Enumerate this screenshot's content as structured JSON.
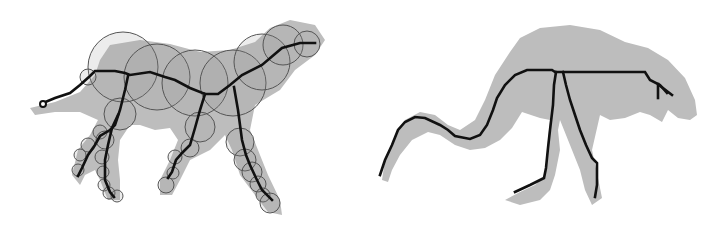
{
  "figure": {
    "panels": [
      {
        "name": "dog-medial-axis",
        "silhouette": "M30,108 L55,102 L80,92 L95,75 L100,60 L110,45 L140,40 L170,44 L200,52 L230,50 L255,42 L270,28 L290,20 L315,25 L325,40 L315,55 L295,70 L280,90 L255,105 L250,130 L258,150 L268,175 L280,200 L282,215 L268,212 L255,195 L240,175 L232,150 L225,135 L210,150 L190,160 L180,180 L172,195 L160,195 L160,180 L170,160 L178,140 L170,128 L155,130 L140,125 L130,125 L120,140 L118,160 L120,180 L120,200 L108,200 L100,180 L95,170 L85,175 L80,185 L72,175 L78,150 L90,135 L98,120 L80,112 L55,112 L35,115 Z",
        "circles": [
          [
            123,
            67,
            35
          ],
          [
            157,
            77,
            33
          ],
          [
            195,
            83,
            33
          ],
          [
            233,
            83,
            33
          ],
          [
            262,
            62,
            28
          ],
          [
            283,
            45,
            20
          ],
          [
            307,
            44,
            13
          ],
          [
            120,
            114,
            16
          ],
          [
            100,
            132,
            7
          ],
          [
            88,
            145,
            7
          ],
          [
            80,
            155,
            6
          ],
          [
            78,
            170,
            6
          ],
          [
            105,
            140,
            9
          ],
          [
            102,
            157,
            7
          ],
          [
            103,
            172,
            6
          ],
          [
            104,
            185,
            6
          ],
          [
            109,
            193,
            6
          ],
          [
            117,
            196,
            6
          ],
          [
            200,
            127,
            15
          ],
          [
            190,
            148,
            9
          ],
          [
            175,
            157,
            7
          ],
          [
            173,
            173,
            6
          ],
          [
            166,
            185,
            8
          ],
          [
            240,
            142,
            14
          ],
          [
            245,
            160,
            11
          ],
          [
            252,
            172,
            10
          ],
          [
            258,
            184,
            8
          ],
          [
            263,
            195,
            7
          ],
          [
            270,
            203,
            10
          ],
          [
            88,
            77,
            8
          ]
        ],
        "skeleton": [
          "M43,103 L55,98 L70,93 L80,85 L90,76 L95,71 L115,71 L125,73 L130,75 L150,72 L165,77 L175,80 L190,88 L205,94 L218,94 L230,85 L242,75 L262,65 L282,48 L300,43 L315,43",
          "M128,76 L125,90 L120,110 L115,125 L110,130 L100,136 L95,145 L88,155 L82,168 L78,176",
          "M118,115 L112,128 L108,145 L105,160 L105,180 L110,192 L114,197",
          "M205,94 L200,110 L195,128 L190,145 L183,152 L176,160 L172,172 L168,178",
          "M234,87 L238,110 L240,125 L242,140 L246,155 L250,165 L256,178 L262,190 L272,200"
        ],
        "tail_node": [
          43,
          104
        ]
      },
      {
        "name": "bird-medial-axis",
        "silhouette": "M382,180 L385,160 L393,140 L405,120 L420,112 L435,115 L448,125 L460,130 L475,120 L485,100 L495,75 L510,52 L520,38 L540,28 L570,25 L600,30 L625,42 L648,48 L668,60 L685,78 L695,100 L697,115 L690,120 L678,118 L668,110 L662,122 L650,115 L640,112 L625,118 L610,120 L600,115 L592,150 L598,178 L602,198 L592,205 L585,190 L580,170 L570,145 L560,120 L558,130 L560,150 L555,175 L550,190 L540,200 L520,205 L505,200 L520,192 L535,185 L545,175 L548,140 L550,120 L540,118 L522,112 L512,128 L500,140 L485,148 L470,150 L455,145 L440,135 L428,132 L412,140 L400,155 L392,170 L388,182 Z",
        "skeleton": [
          "M380,175 L385,160 L392,145 L398,130 L405,122 L415,117 L425,118 L440,125 L448,130 L455,136 L470,139 L480,135 L487,125 L493,110 L497,98 L505,85 L515,75 L527,70 L552,70 L555,72 L645,72 L650,80 L660,85 L667,93",
          "M556,72 L554,85 L553,105 L550,130 L548,148 L546,168 L544,178 L530,185 L515,192",
          "M563,72 L566,85 L570,100 L575,115 L580,130 L586,145 L592,158 L597,163 L597,185 L595,197",
          "M658,84 L658,98",
          "M659,85 L672,95"
        ]
      }
    ]
  }
}
